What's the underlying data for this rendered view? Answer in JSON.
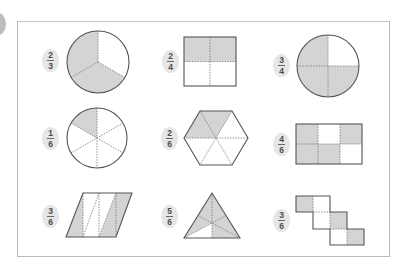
{
  "colors": {
    "shade": "#d4d4d4",
    "outline": "#555555",
    "divider": "#777777",
    "badge_bg": "#e6e6e6",
    "frame": "#b9b9b9"
  },
  "items": [
    {
      "numerator": "2",
      "denominator": "3",
      "shape": "circle-thirds",
      "shaded_parts": 2,
      "total_parts": 3
    },
    {
      "numerator": "2",
      "denominator": "4",
      "shape": "square-quarters",
      "shaded_parts": 2,
      "total_parts": 4
    },
    {
      "numerator": "3",
      "denominator": "4",
      "shape": "circle-quarters",
      "shaded_parts": 3,
      "total_parts": 4
    },
    {
      "numerator": "1",
      "denominator": "6",
      "shape": "circle-sixths",
      "shaded_parts": 1,
      "total_parts": 6
    },
    {
      "numerator": "2",
      "denominator": "6",
      "shape": "hexagon-sixths",
      "shaded_parts": 2,
      "total_parts": 6
    },
    {
      "numerator": "4",
      "denominator": "6",
      "shape": "rectangle-sixths",
      "shaded_parts": 4,
      "total_parts": 6
    },
    {
      "numerator": "3",
      "denominator": "6",
      "shape": "parallelogram-sixths",
      "shaded_parts": 3,
      "total_parts": 6
    },
    {
      "numerator": "5",
      "denominator": "6",
      "shape": "triangle-sixths",
      "shaded_parts": 5,
      "total_parts": 6
    },
    {
      "numerator": "3",
      "denominator": "6",
      "shape": "staircase-squares",
      "shaded_parts": 3,
      "total_parts": 6
    }
  ]
}
